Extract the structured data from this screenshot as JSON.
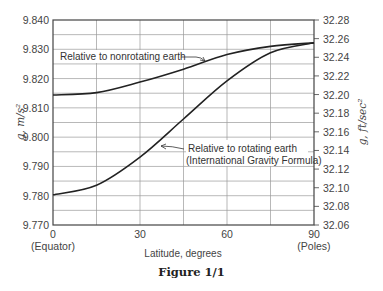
{
  "figure": {
    "caption": "Figure 1/1"
  },
  "chart_data": {
    "type": "line",
    "title": "",
    "xlabel": "Latitude, degrees",
    "ylabel": "g, m/s²",
    "ylabel_right": "g, ft/sec²",
    "x": [
      0,
      15,
      30,
      45,
      60,
      75,
      90
    ],
    "xlim": [
      0,
      90
    ],
    "ylim": [
      9.77,
      9.84
    ],
    "ylim_right": [
      32.06,
      32.28
    ],
    "x_ticks": [
      {
        "value": 0,
        "label": "0",
        "sublabel": "(Equator)"
      },
      {
        "value": 30,
        "label": "30",
        "sublabel": ""
      },
      {
        "value": 60,
        "label": "60",
        "sublabel": ""
      },
      {
        "value": 90,
        "label": "90",
        "sublabel": "(Poles)"
      }
    ],
    "y_ticks_left": [
      "9.840",
      "9.830",
      "9.820",
      "9.810",
      "9.800",
      "9.790",
      "9.780",
      "9.770"
    ],
    "y_ticks_right": [
      "32.28",
      "32.26",
      "32.24",
      "32.22",
      "32.20",
      "32.18",
      "32.16",
      "32.14",
      "32.12",
      "32.10",
      "32.08",
      "32.06"
    ],
    "grid": true,
    "series": [
      {
        "name": "Relative to nonrotating earth",
        "values": [
          9.8144,
          9.8152,
          9.8188,
          9.8232,
          9.8282,
          9.831,
          9.8322
        ]
      },
      {
        "name": "Relative to rotating earth (International Gravity Formula)",
        "values": [
          9.7803,
          9.7836,
          9.7932,
          9.8062,
          9.8192,
          9.8288,
          9.8322
        ]
      }
    ],
    "annotations": [
      {
        "text": "Relative to nonrotating earth",
        "line2": ""
      },
      {
        "text": "Relative to rotating earth",
        "line2": "(International Gravity Formula)"
      }
    ]
  }
}
